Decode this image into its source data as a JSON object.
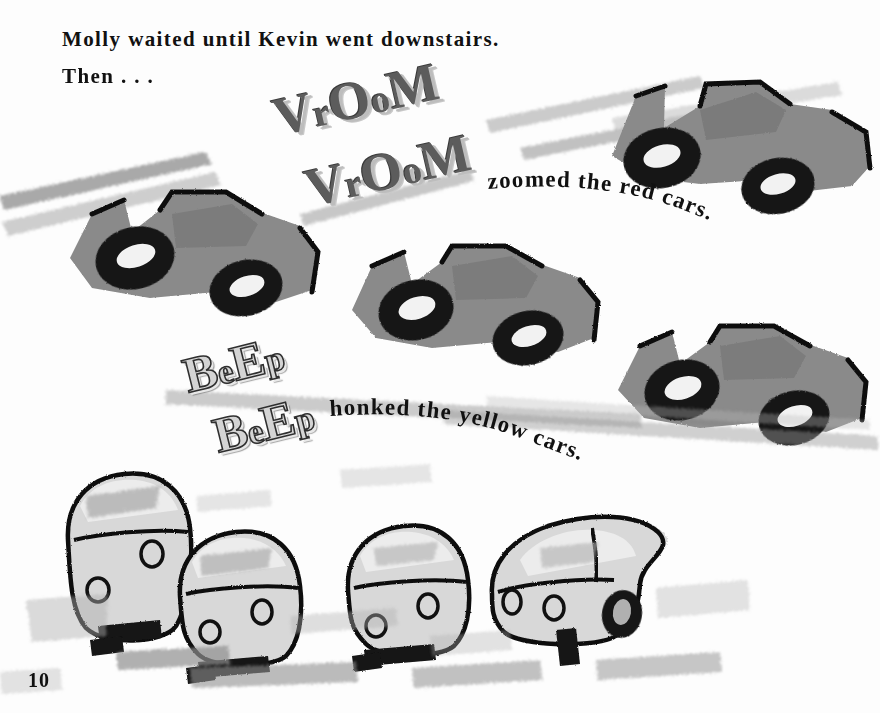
{
  "page": {
    "number": "10",
    "background_color": "#fdfdfd",
    "width": 880,
    "height": 713
  },
  "story_text": {
    "line_1": "Molly waited until Kevin went downstairs.",
    "line_2": "Then . . ."
  },
  "sound_effects": [
    {
      "name": "vroom-1",
      "text_parts": [
        "V",
        "r",
        "O",
        "o",
        "M"
      ],
      "plain_text": "VrOoM",
      "style": "solid-gray-shadow",
      "color": "#5c5c5c",
      "shadow_color": "#bdbdbd"
    },
    {
      "name": "vroom-2",
      "text_parts": [
        "V",
        "r",
        "O",
        "o",
        "M"
      ],
      "plain_text": "VrOoM",
      "style": "solid-gray-shadow",
      "color": "#5c5c5c",
      "shadow_color": "#bdbdbd"
    },
    {
      "name": "beep-1",
      "text_parts": [
        "B",
        "e",
        "E",
        "p"
      ],
      "plain_text": "BeEp",
      "style": "hollow-outline",
      "color": "#d4d4d4",
      "outline_color": "#2f2f2f"
    },
    {
      "name": "beep-2",
      "text_parts": [
        "B",
        "e",
        "E",
        "p"
      ],
      "plain_text": "BeEp",
      "style": "hollow-outline",
      "color": "#d4d4d4",
      "outline_color": "#2f2f2f"
    }
  ],
  "captions": {
    "red_cars": "zoomed the red cars.",
    "yellow_cars": "honked the yellow cars."
  },
  "illustration": {
    "description": "Brush-and-ink drawing of toy cars racing across a page",
    "race_cars": [
      {
        "name": "race-car-left",
        "color_name": "red",
        "render": "mid-gray"
      },
      {
        "name": "race-car-top-right",
        "color_name": "red",
        "render": "mid-gray"
      },
      {
        "name": "race-car-middle",
        "color_name": "red",
        "render": "mid-gray"
      },
      {
        "name": "race-car-right",
        "color_name": "red",
        "render": "mid-gray"
      }
    ],
    "small_cars": [
      {
        "name": "small-car-1",
        "color_name": "yellow",
        "render": "light-gray"
      },
      {
        "name": "small-car-2",
        "color_name": "yellow",
        "render": "light-gray"
      },
      {
        "name": "small-car-3",
        "color_name": "yellow",
        "render": "light-gray"
      },
      {
        "name": "small-car-4",
        "color_name": "yellow",
        "render": "light-gray"
      }
    ],
    "speed_lines_count": 6,
    "palette": {
      "car_body": "#8a8a8a",
      "wheel": "#141414",
      "small_car_body": "#d8d8d8",
      "speed_line": "#9a9a9a",
      "ink_outline": "#111111"
    }
  }
}
